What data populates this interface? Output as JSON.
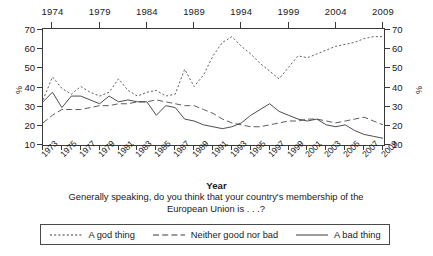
{
  "chart_data": {
    "type": "line",
    "title": "",
    "question": "Generally speaking, do you think that your country's membership of the European Union is . . .?",
    "xlabel": "Year",
    "ylabel": "%",
    "ylabel_right": "%",
    "ylim": [
      10,
      70
    ],
    "yticks": [
      10,
      20,
      30,
      40,
      50,
      60,
      70
    ],
    "yticks_right": [
      10,
      20,
      30,
      40,
      50,
      60,
      70
    ],
    "xlim": [
      1973,
      2009
    ],
    "grid": false,
    "legend_position": "bottom",
    "top_axis_ticks": [
      1974,
      1979,
      1984,
      1989,
      1994,
      1999,
      2004,
      2009
    ],
    "x": [
      1973,
      1974,
      1975,
      1976,
      1977,
      1978,
      1979,
      1980,
      1981,
      1982,
      1983,
      1984,
      1985,
      1986,
      1987,
      1988,
      1989,
      1990,
      1991,
      1992,
      1993,
      1994,
      1995,
      1996,
      1997,
      1998,
      1999,
      2000,
      2001,
      2002,
      2003,
      2004,
      2005,
      2006,
      2007,
      2008,
      2009
    ],
    "xtick_labels": [
      1973,
      1975,
      1977,
      1979,
      1981,
      1983,
      1985,
      1987,
      1989,
      1991,
      1993,
      1995,
      1997,
      1999,
      2001,
      2003,
      2005,
      2007,
      2009
    ],
    "series": [
      {
        "name": "A god thing",
        "style": "dotted",
        "color": "#4a4a4a",
        "values": [
          33,
          45,
          39,
          36,
          40,
          37,
          35,
          37,
          44,
          38,
          35,
          37,
          38,
          35,
          36,
          49,
          40,
          46,
          56,
          63,
          66,
          61,
          57,
          52,
          48,
          44,
          50,
          56,
          55,
          57,
          59,
          61,
          62,
          63,
          65,
          66,
          66
        ]
      },
      {
        "name": "Neither good nor bad",
        "style": "dashed",
        "color": "#4a4a4a",
        "values": [
          21,
          25,
          28,
          28,
          28,
          29,
          30,
          30,
          31,
          31,
          32,
          32,
          33,
          32,
          31,
          30,
          30,
          28,
          26,
          23,
          21,
          20,
          19,
          19,
          20,
          21,
          22,
          22,
          23,
          23,
          22,
          21,
          22,
          23,
          24,
          22,
          20
        ]
      },
      {
        "name": "A bad thing",
        "style": "solid",
        "color": "#3a3a3a",
        "values": [
          32,
          37,
          29,
          35,
          35,
          33,
          31,
          35,
          32,
          33,
          32,
          32,
          25,
          30,
          29,
          23,
          22,
          20,
          19,
          18,
          19,
          21,
          25,
          28,
          31,
          27,
          25,
          23,
          22,
          23,
          20,
          19,
          20,
          17,
          15,
          14,
          13
        ]
      }
    ]
  },
  "legend": {
    "items": [
      {
        "label": "A god thing",
        "style": "dotted"
      },
      {
        "label": "Neither good nor bad",
        "style": "dashed"
      },
      {
        "label": "A bad thing",
        "style": "solid"
      }
    ]
  }
}
